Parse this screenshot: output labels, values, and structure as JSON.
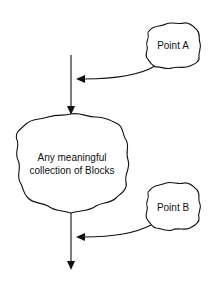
{
  "diagram": {
    "nodes": [
      {
        "id": "main",
        "label_lines": [
          "Any meaningful",
          "collection of Blocks"
        ],
        "shape": "cloud"
      },
      {
        "id": "point_a",
        "label": "Point A",
        "shape": "cloud"
      },
      {
        "id": "point_b",
        "label": "Point B",
        "shape": "cloud"
      }
    ],
    "edges": [
      {
        "from": "entry",
        "to": "main",
        "style": "straight-arrow"
      },
      {
        "from": "point_a",
        "to": "entry-line",
        "style": "curved-arrow"
      },
      {
        "from": "main",
        "to": "exit",
        "style": "straight-arrow"
      },
      {
        "from": "point_b",
        "to": "exit-line",
        "style": "curved-arrow"
      }
    ],
    "colors": {
      "stroke": "#111111",
      "background": "#ffffff"
    }
  }
}
